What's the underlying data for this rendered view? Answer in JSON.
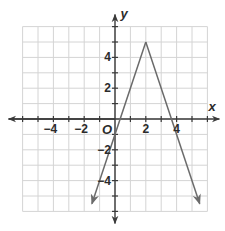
{
  "chart_data": {
    "type": "line",
    "title": "",
    "xlabel": "x",
    "ylabel": "y",
    "origin_label": "O",
    "xlim": [
      -6,
      6
    ],
    "ylim": [
      -6,
      6
    ],
    "grid": true,
    "x_ticks": [
      -4,
      -2,
      2,
      4
    ],
    "y_ticks": [
      4,
      2,
      -2,
      -4
    ],
    "x_tick_labels": [
      "−4",
      "−2",
      "2",
      "4"
    ],
    "y_tick_labels": [
      "4",
      "2",
      "−2",
      "−4"
    ],
    "series": [
      {
        "name": "y = -3|x - 2| + 5",
        "x": [
          -1.5,
          2,
          5.5
        ],
        "y": [
          -5.5,
          5,
          -5.5
        ],
        "arrows_at_ends": true,
        "color": "#6b6b6b"
      }
    ]
  }
}
